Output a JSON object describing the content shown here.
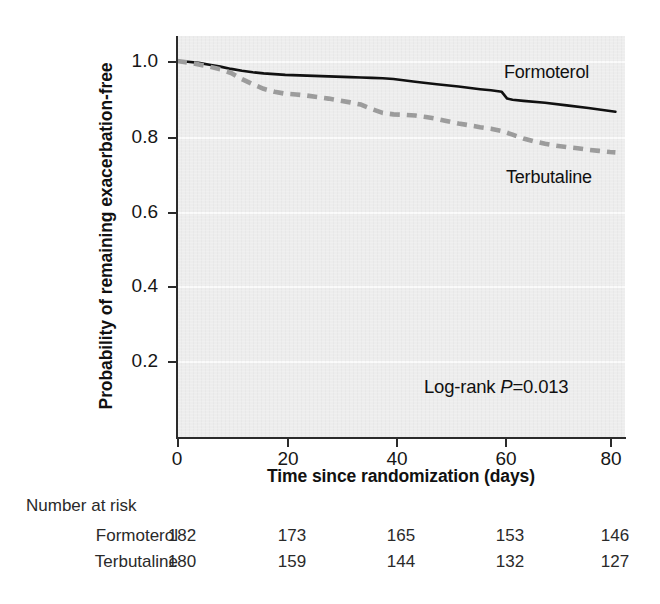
{
  "figure": {
    "kind": "kaplan-meier-survival-plot"
  },
  "chart_data": {
    "type": "line",
    "title": "",
    "xlabel": "Time since randomization (days)",
    "ylabel": "Probability of remaining exacerbation-free",
    "xlim": [
      0,
      81
    ],
    "ylim": [
      0,
      1.04
    ],
    "grid": true,
    "legend_position": "inside-right",
    "x_ticks": [
      {
        "value": 0,
        "label": "0"
      },
      {
        "value": 20,
        "label": "20"
      },
      {
        "value": 40,
        "label": "40"
      },
      {
        "value": 60,
        "label": "60"
      },
      {
        "value": 80,
        "label": "80"
      }
    ],
    "y_ticks": [
      {
        "value": 1.0,
        "label": "1.0"
      },
      {
        "value": 0.8,
        "label": "0.8"
      },
      {
        "value": 0.6,
        "label": "0.6"
      },
      {
        "value": 0.4,
        "label": "0.4"
      },
      {
        "value": 0.2,
        "label": "0.2"
      }
    ],
    "annotations": [
      {
        "name": "log-rank-p",
        "text_prefix": "Log-rank ",
        "text_italic": "P",
        "text_suffix": "=0.013",
        "x": 57,
        "y": 0.13
      }
    ],
    "series": [
      {
        "name": "Formoterol",
        "color": "#111111",
        "style": "solid",
        "label_x": 73,
        "label_y": 0.955,
        "x": [
          0,
          2,
          4,
          6,
          8,
          10,
          12,
          14,
          16,
          18,
          20,
          24,
          28,
          32,
          34,
          36,
          38,
          40,
          44,
          48,
          52,
          56,
          58,
          60,
          61,
          62,
          64,
          68,
          72,
          76,
          80,
          81
        ],
        "y": [
          1.0,
          0.998,
          0.995,
          0.99,
          0.985,
          0.979,
          0.974,
          0.97,
          0.967,
          0.965,
          0.963,
          0.961,
          0.959,
          0.957,
          0.956,
          0.955,
          0.954,
          0.952,
          0.945,
          0.938,
          0.932,
          0.925,
          0.922,
          0.918,
          0.9,
          0.897,
          0.894,
          0.889,
          0.882,
          0.875,
          0.867,
          0.865
        ]
      },
      {
        "name": "Terbutaline",
        "color": "#9c9c9c",
        "style": "dashed",
        "label_x": 74,
        "label_y": 0.69,
        "x": [
          0,
          2,
          4,
          6,
          8,
          10,
          12,
          14,
          16,
          18,
          20,
          22,
          24,
          26,
          28,
          30,
          32,
          34,
          36,
          38,
          40,
          42,
          44,
          46,
          48,
          50,
          52,
          54,
          56,
          58,
          60,
          62,
          64,
          66,
          68,
          70,
          72,
          74,
          76,
          78,
          80,
          81
        ],
        "y": [
          1.0,
          0.996,
          0.991,
          0.985,
          0.978,
          0.968,
          0.952,
          0.938,
          0.926,
          0.918,
          0.913,
          0.911,
          0.908,
          0.904,
          0.9,
          0.895,
          0.89,
          0.884,
          0.872,
          0.862,
          0.858,
          0.857,
          0.855,
          0.851,
          0.846,
          0.84,
          0.834,
          0.829,
          0.824,
          0.82,
          0.814,
          0.804,
          0.794,
          0.786,
          0.78,
          0.775,
          0.771,
          0.768,
          0.764,
          0.761,
          0.758,
          0.757
        ]
      }
    ]
  },
  "risk_table": {
    "title": "Number at risk",
    "time_points": [
      0,
      20,
      40,
      60,
      80
    ],
    "rows": [
      {
        "name": "Formoterol",
        "values": [
          "182",
          "173",
          "165",
          "153",
          "146"
        ]
      },
      {
        "name": "Terbutaline",
        "values": [
          "180",
          "159",
          "144",
          "132",
          "127"
        ]
      }
    ]
  },
  "colors": {
    "plot_background": "#ededed",
    "axis": "#2b2b2b",
    "gridline": "#fbfbfb",
    "formoterol": "#111111",
    "terbutaline": "#9c9c9c"
  }
}
